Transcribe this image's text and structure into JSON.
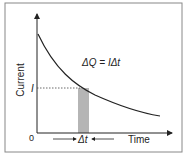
{
  "diagram": {
    "y_axis_label": "Current",
    "x_axis_label": "Time",
    "origin_label": "0",
    "current_marker_label": "I",
    "equation": "ΔQ = IΔt",
    "interval_label": "Δt"
  },
  "colors": {
    "frame": "#888888",
    "curve": "#222222",
    "shaded_area": "#b5b5b5",
    "text": "#222222"
  }
}
